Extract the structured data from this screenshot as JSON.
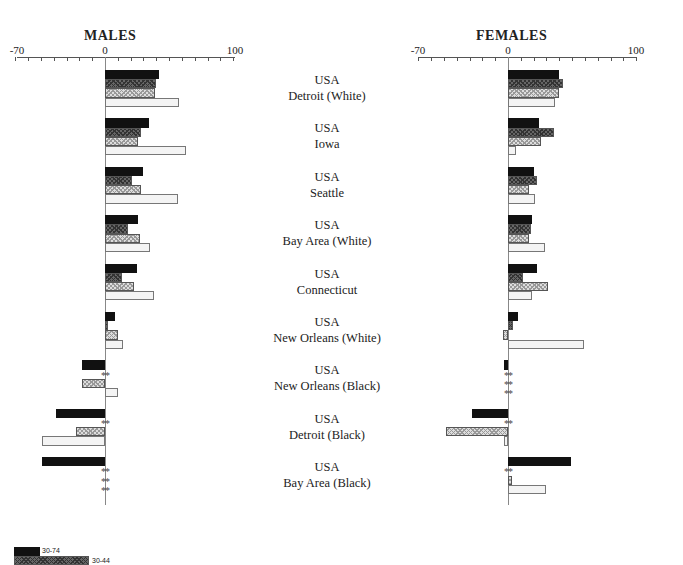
{
  "panels": {
    "males": {
      "title": "MALES"
    },
    "females": {
      "title": "FEMALES"
    }
  },
  "axis": {
    "tick_labels": [
      "-70",
      "0",
      "100"
    ]
  },
  "legend": [
    {
      "label": "30-74"
    },
    {
      "label": "30-44"
    }
  ],
  "colors": {
    "s0": "#111111",
    "s1": "#555555",
    "s2": "#bbbbbb",
    "s3": "#f4f4f4"
  },
  "chart_data": {
    "type": "bar",
    "orientation": "horizontal",
    "title": "",
    "xlim": [
      -70,
      100
    ],
    "xticks_labeled": [
      -70,
      0,
      100
    ],
    "tick_interval": 10,
    "missing_marker": "**",
    "categories": [
      "USA Detroit (White)",
      "USA Iowa",
      "USA Seattle",
      "USA Bay Area (White)",
      "USA Connecticut",
      "USA New Orleans (White)",
      "USA New Orleans (Black)",
      "USA Detroit (Black)",
      "USA Bay Area (Black)"
    ],
    "category_lines": [
      [
        "USA",
        "Detroit (White)"
      ],
      [
        "USA",
        "Iowa"
      ],
      [
        "USA",
        "Seattle"
      ],
      [
        "USA",
        "Bay Area (White)"
      ],
      [
        "USA",
        "Connecticut"
      ],
      [
        "USA",
        "New Orleans (White)"
      ],
      [
        "USA",
        "New Orleans (Black)"
      ],
      [
        "USA",
        "Detroit (Black)"
      ],
      [
        "USA",
        "Bay Area (Black)"
      ]
    ],
    "legend": [
      "30-74",
      "30-44",
      "(series 3, legend cut off)",
      "(series 4, legend cut off)"
    ],
    "panels": [
      {
        "title": "MALES",
        "series": [
          {
            "name": "30-74",
            "values": [
              42,
              34,
              30,
              26,
              25,
              8,
              -18,
              -38,
              -49
            ]
          },
          {
            "name": "30-44",
            "values": [
              40,
              28,
              21,
              18,
              13,
              2,
              null,
              null,
              null
            ]
          },
          {
            "name": "series 3",
            "values": [
              39,
              26,
              28,
              27,
              23,
              10,
              -18,
              -23,
              null
            ]
          },
          {
            "name": "series 4",
            "values": [
              58,
              63,
              57,
              35,
              38,
              14,
              10,
              -49,
              null
            ]
          }
        ]
      },
      {
        "title": "FEMALES",
        "series": [
          {
            "name": "30-74",
            "values": [
              40,
              24,
              20,
              19,
              23,
              8,
              -3,
              -28,
              49
            ]
          },
          {
            "name": "30-44",
            "values": [
              43,
              36,
              23,
              18,
              12,
              4,
              null,
              null,
              null
            ]
          },
          {
            "name": "series 3",
            "values": [
              40,
              26,
              16,
              16,
              31,
              -4,
              null,
              -48,
              3
            ]
          },
          {
            "name": "series 4",
            "values": [
              37,
              6,
              21,
              29,
              19,
              59,
              null,
              -3,
              30
            ]
          }
        ]
      }
    ]
  }
}
